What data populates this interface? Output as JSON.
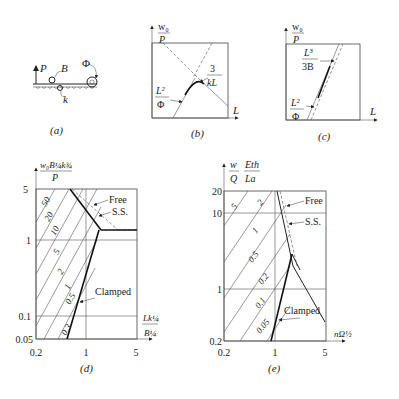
{
  "panels": {
    "a": {
      "caption": "(a)",
      "labels": {
        "P": "P",
        "B": "B",
        "k": "k",
        "Phi": "Φ"
      }
    },
    "b": {
      "caption": "(b)",
      "y_label_num": "w₀",
      "y_label_den": "P",
      "x_label": "L",
      "annot1_num": "3",
      "annot1_den": "kL",
      "annot2_num": "L²",
      "annot2_den": "Φ"
    },
    "c": {
      "caption": "(c)",
      "y_label_num": "w₀",
      "y_label_den": "P",
      "x_label": "L",
      "annot1_num": "L³",
      "annot1_den": "3B",
      "annot2_num": "L²",
      "annot2_den": "Φ"
    },
    "d": {
      "caption": "(d)",
      "y_label_num": "w₀B¼k¾",
      "y_label_den": "P",
      "x_label_num": "Lk¼",
      "x_label_den": "B¼",
      "y_ticks": [
        "5",
        "1",
        "0.1",
        "0.05"
      ],
      "x_ticks": [
        "0.2",
        "1",
        "5"
      ],
      "curve_labels": [
        "50",
        "20",
        "10",
        "5",
        "2",
        "1",
        "0.5",
        "0.3"
      ],
      "legend": {
        "free": "Free",
        "ss": "S.S.",
        "clamped": "Clamped"
      }
    },
    "e": {
      "caption": "(e)",
      "y_label_a_num": "w",
      "y_label_a_den": "Q",
      "y_label_b_num": "Eth",
      "y_label_b_den": "La",
      "x_label": "nΩ½",
      "y_ticks": [
        "20",
        "10",
        "1",
        "0.2"
      ],
      "x_ticks": [
        "0.2",
        "1",
        "5"
      ],
      "curve_labels": [
        "5",
        "2",
        "1",
        "0.5",
        "0.2",
        "0.1",
        "0.05"
      ],
      "legend": {
        "free": "Free",
        "ss": "S.S.",
        "clamped": "Clamped"
      }
    }
  }
}
